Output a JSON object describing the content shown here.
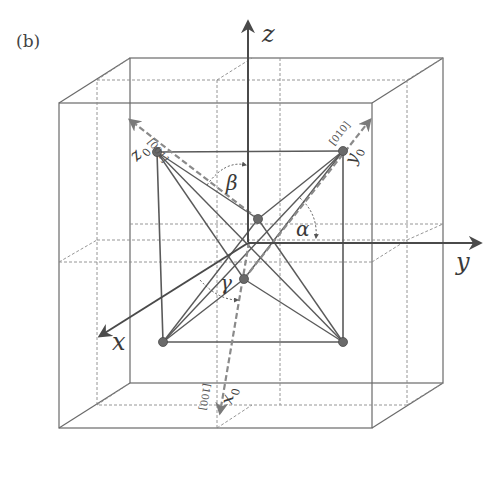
{
  "figure": {
    "panel_label": "(b)",
    "axes": {
      "x": "x",
      "y": "y",
      "z": "z"
    },
    "crystal_axes": {
      "x0": {
        "label": "x",
        "subscript": "0",
        "direction": "[100]"
      },
      "y0": {
        "label": "y",
        "subscript": "0",
        "direction": "[010]"
      },
      "z0": {
        "label": "z",
        "subscript": "0",
        "direction": "[001]"
      }
    },
    "angles": {
      "alpha": "α",
      "beta": "β",
      "gamma": "γ"
    },
    "colors": {
      "line": "#555555",
      "dashed": "#888888",
      "ball": "#6a6a6a",
      "background": "#ffffff"
    }
  }
}
